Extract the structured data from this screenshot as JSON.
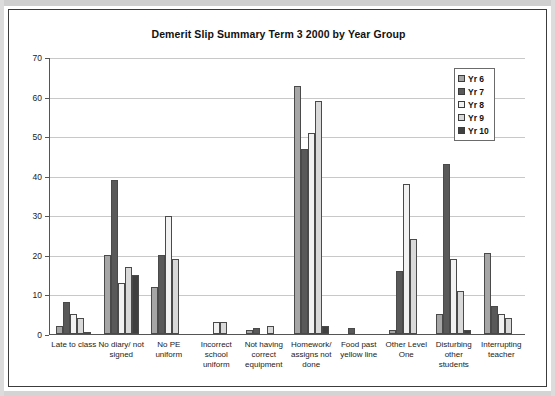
{
  "chart_data": {
    "type": "bar",
    "title": "Demerit Slip Summary Term 3 2000  by Year Group",
    "xlabel": "",
    "ylabel": "",
    "ylim": [
      0,
      70
    ],
    "yticks": [
      0,
      10,
      20,
      30,
      40,
      50,
      60,
      70
    ],
    "grid": true,
    "legend_position": "top-right",
    "categories": [
      "Late to class",
      "No diary/ not signed",
      "No PE uniform",
      "Incorrect school uniform",
      "Not having correct equipment",
      "Homework/ assigns not done",
      "Food past yellow line",
      "Other Level One",
      "Disturbing other students",
      "Interrupting teacher"
    ],
    "series": [
      {
        "name": "Yr 6",
        "color": "#a6a6a6",
        "values": [
          2,
          20,
          12,
          0,
          1,
          63,
          0,
          1,
          5,
          20.5
        ]
      },
      {
        "name": "Yr 7",
        "color": "#595959",
        "values": [
          8,
          39,
          20,
          0,
          1.5,
          47,
          1.5,
          16,
          43,
          7
        ]
      },
      {
        "name": "Yr 8",
        "color": "#f2f2f2",
        "values": [
          5,
          13,
          30,
          3,
          0,
          51,
          0,
          38,
          19,
          5
        ]
      },
      {
        "name": "Yr 9",
        "color": "#d9d9d9",
        "values": [
          4,
          17,
          19,
          3,
          2,
          59,
          0,
          24,
          11,
          4
        ]
      },
      {
        "name": "Yr 10",
        "color": "#404040",
        "values": [
          0.5,
          15,
          0,
          0,
          0,
          2,
          0,
          0,
          1,
          0
        ]
      }
    ]
  },
  "legend": {
    "items": [
      {
        "label": "Yr 6"
      },
      {
        "label": "Yr 7"
      },
      {
        "label": "Yr 8"
      },
      {
        "label": "Yr 9"
      },
      {
        "label": "Yr 10"
      }
    ]
  }
}
